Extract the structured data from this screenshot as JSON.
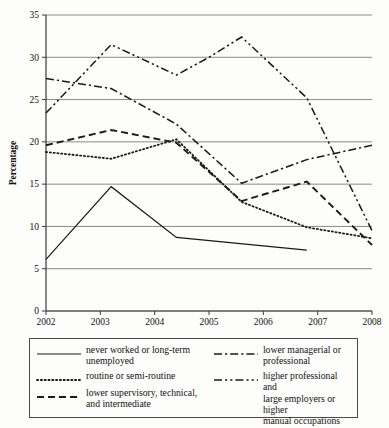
{
  "chart_data": {
    "type": "line",
    "title": "",
    "xlabel": "",
    "ylabel": "Percentage",
    "xlim": [
      2002,
      2008
    ],
    "ylim": [
      0,
      35
    ],
    "ytick_labels": [
      "0",
      "5",
      "10",
      "15",
      "20",
      "25",
      "30",
      "35"
    ],
    "yticks": [
      0,
      5,
      10,
      15,
      20,
      25,
      30,
      35
    ],
    "xtick_labels": [
      "2002",
      "2003",
      "2004",
      "2005",
      "2006",
      "2007",
      "2008"
    ],
    "xticks": [
      2002,
      2003,
      2004,
      2005,
      2006,
      2007,
      2008
    ],
    "grid": "horizontal",
    "legend_position": "below-plot",
    "series": [
      {
        "name": "never worked or long-term unemployed",
        "style": "solid",
        "x": [
          2002.0,
          2003.2,
          2004.4,
          2006.8
        ],
        "values": [
          6.1,
          14.7,
          8.7,
          7.2
        ]
      },
      {
        "name": "routine or semi-routine",
        "style": "dotted",
        "x": [
          2002.0,
          2003.2,
          2004.4,
          2005.6,
          2006.8,
          2008.0
        ],
        "values": [
          18.8,
          18.0,
          20.3,
          12.9,
          9.9,
          8.6
        ]
      },
      {
        "name": "lower supervisory, technical, and intermediate",
        "style": "dashed",
        "x": [
          2002.0,
          2003.2,
          2004.4,
          2005.6,
          2006.8,
          2008.0
        ],
        "values": [
          19.6,
          21.4,
          19.9,
          13.0,
          15.3,
          7.8
        ]
      },
      {
        "name": "lower managerial or professional",
        "style": "dash-dot",
        "x": [
          2002.0,
          2003.2,
          2004.4,
          2005.6,
          2006.8,
          2008.0
        ],
        "values": [
          27.5,
          26.3,
          22.1,
          15.1,
          17.9,
          19.6
        ]
      },
      {
        "name": "higher professional and large employers or higher manual occupations",
        "style": "dash-dot-dot",
        "x": [
          2002.0,
          2003.2,
          2004.4,
          2005.0,
          2005.6,
          2006.8,
          2008.0
        ],
        "values": [
          23.4,
          31.5,
          27.9,
          30.0,
          32.4,
          25.2,
          9.5
        ]
      }
    ]
  },
  "legend": {
    "items": [
      {
        "label": "never worked or long-term\nunemployed",
        "style": "solid",
        "column": "left"
      },
      {
        "label": "routine or semi-routine",
        "style": "dotted",
        "column": "left"
      },
      {
        "label": "lower supervisory, technical,\nand intermediate",
        "style": "dashed",
        "column": "left"
      },
      {
        "label": "lower managerial or\nprofessional",
        "style": "dash-dot",
        "column": "right"
      },
      {
        "label": "higher professional and\nlarge employers or higher\nmanual occupations",
        "style": "dash-dot-dot",
        "column": "right"
      }
    ]
  },
  "colors": {
    "line": "#1a1a1a",
    "grid": "#8a8a8a",
    "axis": "#3a3a3a",
    "background": "#fdfdfb",
    "legend_border": "#4a4a4a"
  }
}
